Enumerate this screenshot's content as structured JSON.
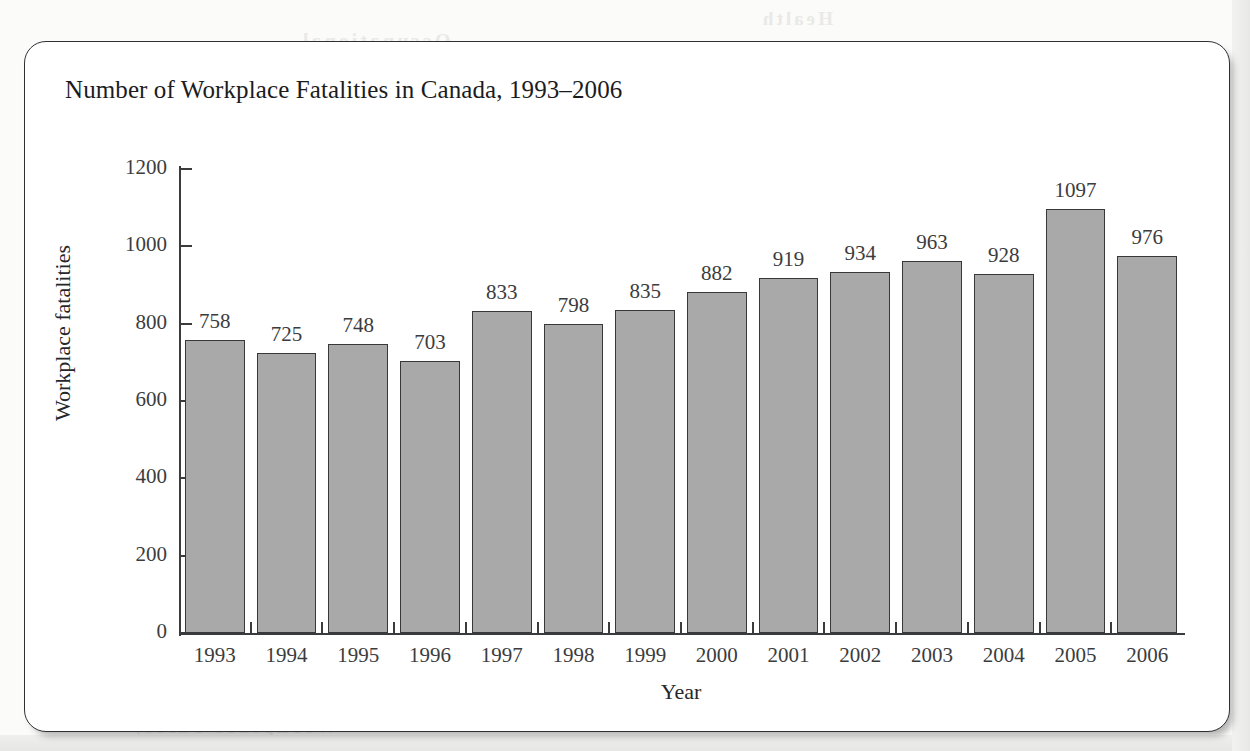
{
  "figure": {
    "title": "Number of Workplace Fatalities in Canada, 1993–2006"
  },
  "background_texts": {
    "bleed_line_1": "Chapter Review",
    "bleed_line_2": "Workplace Safety",
    "bleed_line_3": "Fatalities",
    "bleed_line_4": "Occupational",
    "bleed_line_5": "Health"
  },
  "colors": {
    "bar_fill": "#a9a9a9",
    "bar_border": "#37383a",
    "axis": "#3a3b3d",
    "text": "#26272a",
    "card_border": "#2f3032",
    "page_background": "#fbfbfa",
    "card_background": "#ffffff"
  },
  "chart_data": {
    "type": "bar",
    "title": "Number of Workplace Fatalities in Canada, 1993–2006",
    "xlabel": "Year",
    "ylabel": "Workplace fatalities",
    "categories": [
      "1993",
      "1994",
      "1995",
      "1996",
      "1997",
      "1998",
      "1999",
      "2000",
      "2001",
      "2002",
      "2003",
      "2004",
      "2005",
      "2006"
    ],
    "values": [
      758,
      725,
      748,
      703,
      833,
      798,
      835,
      882,
      919,
      934,
      963,
      928,
      1097,
      976
    ],
    "ylim": [
      0,
      1200
    ],
    "yticks": [
      0,
      200,
      400,
      600,
      800,
      1000,
      1200
    ],
    "ytick_labels": [
      "0",
      "200",
      "400",
      "600",
      "800",
      "1000",
      "1200"
    ],
    "grid": false,
    "legend": "none",
    "data_labels": true
  }
}
